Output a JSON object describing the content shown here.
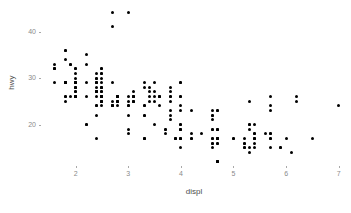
{
  "chart_data": {
    "type": "scatter",
    "title": "",
    "xlabel": "displ",
    "ylabel": "hwy",
    "xlim": [
      1.4,
      7.1
    ],
    "ylim": [
      11.5,
      45.5
    ],
    "xticks": [
      2,
      3,
      4,
      5,
      6,
      7
    ],
    "yticks": [
      20,
      30,
      40
    ],
    "xtick_labels": [
      "2",
      "3",
      "4",
      "5",
      "6",
      "7"
    ],
    "ytick_labels": [
      "20",
      "30",
      "40"
    ],
    "grid": false,
    "legend": "none",
    "point_color": "#000000",
    "axis_text_color": "#8a8a8a",
    "axis_title_color": "#4d4d4d",
    "panel_background": "#ffffff",
    "series": [
      {
        "name": "mpg",
        "x": [
          1.8,
          1.8,
          2.0,
          2.0,
          2.8,
          2.8,
          3.1,
          1.8,
          1.8,
          2.0,
          2.0,
          2.8,
          2.8,
          3.1,
          3.1,
          2.8,
          3.1,
          4.2,
          5.3,
          5.3,
          5.3,
          5.7,
          6.0,
          5.7,
          5.7,
          6.2,
          6.2,
          7.0,
          5.3,
          5.3,
          5.7,
          6.5,
          2.4,
          2.4,
          3.1,
          3.5,
          3.6,
          2.4,
          3.0,
          3.3,
          3.3,
          3.3,
          3.3,
          3.3,
          3.8,
          3.8,
          3.8,
          4.0,
          3.7,
          3.7,
          3.9,
          3.9,
          4.7,
          4.7,
          4.7,
          5.2,
          5.2,
          3.9,
          4.7,
          4.7,
          4.7,
          5.2,
          5.7,
          5.9,
          4.7,
          4.7,
          4.7,
          4.7,
          4.7,
          4.7,
          5.2,
          5.2,
          5.7,
          5.9,
          4.6,
          5.4,
          5.4,
          4.0,
          4.0,
          4.0,
          4.0,
          4.6,
          5.0,
          4.2,
          4.2,
          4.6,
          4.6,
          4.6,
          5.4,
          5.4,
          3.8,
          3.8,
          4.0,
          4.0,
          4.6,
          4.6,
          4.6,
          4.6,
          5.4,
          1.6,
          1.6,
          1.6,
          1.6,
          1.6,
          1.8,
          1.8,
          1.8,
          2.0,
          2.4,
          2.4,
          2.4,
          2.4,
          2.5,
          2.5,
          3.3,
          2.0,
          2.0,
          2.0,
          2.0,
          2.7,
          2.7,
          2.7,
          3.0,
          3.7,
          4.0,
          4.7,
          4.7,
          4.7,
          5.7,
          6.1,
          4.0,
          4.2,
          4.4,
          4.6,
          5.4,
          5.4,
          5.4,
          4.0,
          4.0,
          4.6,
          5.0,
          2.4,
          2.4,
          2.5,
          2.5,
          3.5,
          3.5,
          3.0,
          3.0,
          3.5,
          3.3,
          3.3,
          4.0,
          5.6,
          3.1,
          3.8,
          3.8,
          3.8,
          5.3,
          2.5,
          2.5,
          2.5,
          2.5,
          2.5,
          2.5,
          2.2,
          2.2,
          2.5,
          2.5,
          2.5,
          2.5,
          2.5,
          2.5,
          2.7,
          2.7,
          3.4,
          3.4,
          4.0,
          4.7,
          2.2,
          2.2,
          2.4,
          2.4,
          3.0,
          3.0,
          3.5,
          2.2,
          2.2,
          2.4,
          2.4,
          3.0,
          3.0,
          3.3,
          1.8,
          1.8,
          1.8,
          1.8,
          1.8,
          4.7,
          5.7,
          2.7,
          2.7,
          2.7,
          3.4,
          3.4,
          4.0,
          4.0,
          2.0,
          2.0,
          2.0,
          2.0,
          2.8,
          1.9,
          2.0,
          2.0,
          2.0,
          2.0,
          2.5,
          2.5,
          2.8,
          2.8,
          1.9,
          1.9,
          2.0,
          2.0,
          2.5,
          2.5,
          2.8,
          2.8,
          2.8,
          3.6,
          2.4,
          2.4,
          2.4,
          2.4,
          2.5,
          2.5,
          3.1,
          3.1,
          3.6,
          3.6,
          2.5
        ],
        "y": [
          29,
          29,
          31,
          30,
          26,
          26,
          27,
          26,
          25,
          28,
          27,
          25,
          25,
          25,
          25,
          24,
          25,
          23,
          20,
          15,
          20,
          17,
          17,
          26,
          23,
          26,
          25,
          24,
          19,
          14,
          15,
          17,
          27,
          30,
          26,
          29,
          26,
          24,
          24,
          22,
          22,
          24,
          24,
          17,
          22,
          21,
          23,
          23,
          19,
          18,
          17,
          17,
          19,
          19,
          12,
          17,
          15,
          17,
          17,
          12,
          17,
          16,
          18,
          15,
          16,
          12,
          17,
          17,
          16,
          12,
          15,
          16,
          17,
          15,
          17,
          17,
          18,
          17,
          19,
          17,
          19,
          19,
          17,
          17,
          17,
          16,
          16,
          17,
          15,
          17,
          26,
          25,
          26,
          24,
          21,
          22,
          23,
          22,
          20,
          33,
          32,
          32,
          29,
          32,
          34,
          36,
          36,
          29,
          26,
          27,
          30,
          31,
          26,
          26,
          28,
          26,
          29,
          28,
          27,
          24,
          24,
          24,
          22,
          19,
          20,
          17,
          12,
          19,
          18,
          14,
          15,
          18,
          18,
          15,
          17,
          16,
          18,
          17,
          19,
          19,
          17,
          29,
          27,
          31,
          32,
          27,
          26,
          26,
          25,
          25,
          17,
          17,
          20,
          18,
          26,
          26,
          27,
          28,
          25,
          25,
          25,
          24,
          27,
          25,
          26,
          33,
          35,
          32,
          28,
          31,
          28,
          30,
          28,
          24,
          25,
          27,
          25,
          26,
          23,
          20,
          20,
          22,
          17,
          19,
          18,
          20,
          29,
          26,
          29,
          29,
          24,
          44,
          29,
          26,
          29,
          29,
          29,
          29,
          23,
          24,
          44,
          41,
          29,
          26,
          28,
          29,
          29,
          29,
          29,
          28,
          29,
          26,
          26,
          26,
          26,
          26,
          26,
          26,
          26,
          26,
          26,
          33,
          33,
          32,
          32,
          27,
          26,
          26,
          25,
          25,
          24,
          28,
          24,
          27,
          27,
          26,
          25,
          26,
          26,
          26,
          26,
          29
        ]
      }
    ]
  },
  "axis": {
    "x_title": "displ",
    "y_title": "hwy"
  }
}
